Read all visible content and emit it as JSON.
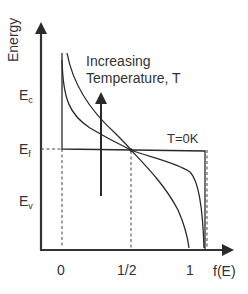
{
  "diagram": {
    "y_axis_label": "Energy",
    "x_axis_label": "f(E)",
    "x_ticks": [
      "0",
      "1/2",
      "1"
    ],
    "energy_levels": {
      "conduction": {
        "main": "E",
        "sub": "c"
      },
      "fermi": {
        "main": "E",
        "sub": "f"
      },
      "valence": {
        "main": "E",
        "sub": "v"
      }
    },
    "annotation_line1": "Increasing",
    "annotation_line2": "Temperature, T",
    "zero_k_label": "T=0K",
    "curves": [
      {
        "name": "T=0K",
        "shape": "step"
      },
      {
        "name": "low T",
        "shape": "steep sigmoid"
      },
      {
        "name": "high T",
        "shape": "broad sigmoid"
      }
    ],
    "colors": {
      "line": "#2a2a2a",
      "text": "#333333",
      "background": "#ffffff"
    }
  }
}
